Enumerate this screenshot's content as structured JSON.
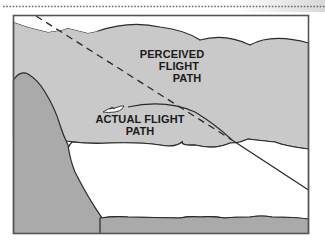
{
  "diagram": {
    "type": "illustration",
    "labels": {
      "perceived": [
        "PERCEIVED",
        "FLIGHT",
        "PATH"
      ],
      "actual": [
        "ACTUAL FLIGHT",
        "PATH"
      ]
    },
    "elements": {
      "perceived_path": {
        "style": "dashed",
        "icon": "dashed-line"
      },
      "actual_path": {
        "style": "solid",
        "icon": "solid-line"
      },
      "aircraft": {
        "icon": "airplane-icon"
      },
      "cloud": {
        "icon": "cloud-layer"
      },
      "mountain": {
        "icon": "mountain-slope"
      },
      "ground": {
        "icon": "ground-strip"
      }
    },
    "colors": {
      "cloud": "#c9c9c9",
      "mountain": "#aaaaaa",
      "ground": "#aaaaaa",
      "sky": "#ffffff",
      "outline": "#2a2a2a",
      "frame": "#555555",
      "text": "#1a1a1a"
    }
  }
}
